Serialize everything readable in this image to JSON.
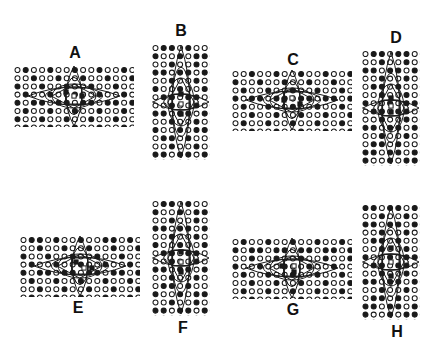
{
  "figure": {
    "type": "multi-panel-lattice-diagram",
    "background_color": "#ffffff",
    "ink_color": "#1a1a1a",
    "panel_count": 8,
    "panel_labels": [
      "A",
      "B",
      "C",
      "D",
      "E",
      "F",
      "G",
      "H"
    ]
  },
  "legend": {
    "open_circle": "open-circle-site",
    "filled_circle": "filled-circle-site",
    "open_square": "open-square-marker",
    "filled_square": "filled-square-marker"
  },
  "panels": [
    {
      "id": "A",
      "label": "A",
      "label_position": "top",
      "orientation": "landscape",
      "x": 14,
      "y": 66,
      "w": 120,
      "h": 61,
      "label_x": 63,
      "label_y": 45,
      "cols": 15,
      "rows": 8,
      "spacing_x": 8.2,
      "spacing_y": 8.2,
      "dot_radius": 2.5,
      "pattern": [
        "010010010010010",
        "001001001001001",
        "100100100100100",
        "010010010010010",
        "101101101101101",
        "010010010010010",
        "100100100100100",
        "010010010010010"
      ],
      "overlay": {
        "horizontal_lens": {
          "cx": 60,
          "cy": 30,
          "rx": 46,
          "ry": 9
        },
        "vertical_lens": {
          "cx": 60,
          "cy": 30,
          "rx": 8,
          "ry": 30
        },
        "mid_ellipse": {
          "cx": 60,
          "cy": 30,
          "rx": 22,
          "ry": 12
        },
        "rect": {
          "x": 52,
          "y": 22,
          "w": 16,
          "h": 16
        },
        "markers": [
          {
            "type": "filled-square",
            "x": 52,
            "y": 26
          },
          {
            "type": "filled-square",
            "x": 68,
            "y": 30
          },
          {
            "type": "open-square",
            "x": 60,
            "y": 30
          }
        ]
      }
    },
    {
      "id": "B",
      "label": "B",
      "label_position": "top",
      "orientation": "portrait",
      "x": 152,
      "y": 44,
      "w": 58,
      "h": 116,
      "label_x": 169,
      "label_y": 23,
      "cols": 8,
      "rows": 15,
      "spacing_x": 8.2,
      "spacing_y": 8.2,
      "dot_radius": 2.5,
      "pattern": [
        "01101001",
        "10010110",
        "00100100",
        "11011011",
        "00100100",
        "10010010",
        "01101101",
        "00100100",
        "11011011",
        "00100100",
        "10010110",
        "01101001",
        "00100100",
        "11011011",
        "01101001"
      ],
      "overlay": {
        "horizontal_lens": {
          "cx": 29,
          "cy": 58,
          "rx": 28,
          "ry": 8
        },
        "vertical_lens": {
          "cx": 29,
          "cy": 58,
          "rx": 9,
          "ry": 56
        },
        "mid_ellipse": {
          "cx": 29,
          "cy": 58,
          "rx": 13,
          "ry": 24
        },
        "rect": {
          "x": 21,
          "y": 50,
          "w": 16,
          "h": 16
        },
        "markers": [
          {
            "type": "filled-square",
            "x": 29,
            "y": 50
          },
          {
            "type": "filled-square",
            "x": 29,
            "y": 70
          },
          {
            "type": "open-square",
            "x": 29,
            "y": 60
          }
        ]
      }
    },
    {
      "id": "C",
      "label": "C",
      "label_position": "top",
      "orientation": "landscape",
      "x": 232,
      "y": 70,
      "w": 120,
      "h": 61,
      "label_x": 281,
      "label_y": 52,
      "cols": 15,
      "rows": 8,
      "spacing_x": 8.2,
      "spacing_y": 8.2,
      "dot_radius": 2.5,
      "pattern": [
        "001001001001001",
        "100100100100100",
        "010010010010010",
        "101101101101101",
        "010010010010010",
        "001001001001001",
        "010010010010010",
        "001001001001001"
      ],
      "overlay": {
        "horizontal_lens": {
          "cx": 60,
          "cy": 30,
          "rx": 46,
          "ry": 9
        },
        "vertical_lens": {
          "cx": 60,
          "cy": 30,
          "rx": 8,
          "ry": 30
        },
        "mid_ellipse": {
          "cx": 60,
          "cy": 30,
          "rx": 22,
          "ry": 12
        },
        "rect": {
          "x": 52,
          "y": 22,
          "w": 16,
          "h": 16
        },
        "markers": [
          {
            "type": "filled-square",
            "x": 52,
            "y": 30
          },
          {
            "type": "filled-square",
            "x": 68,
            "y": 34
          },
          {
            "type": "open-square",
            "x": 60,
            "y": 28
          }
        ]
      }
    },
    {
      "id": "D",
      "label": "D",
      "label_position": "top",
      "orientation": "portrait",
      "x": 362,
      "y": 50,
      "w": 58,
      "h": 116,
      "label_x": 384,
      "label_y": 30,
      "cols": 8,
      "rows": 15,
      "spacing_x": 8.2,
      "spacing_y": 8.2,
      "dot_radius": 2.5,
      "pattern": [
        "01101101",
        "00100100",
        "11011011",
        "00100100",
        "01101001",
        "00100100",
        "10010110",
        "01101101",
        "00100100",
        "11011011",
        "00100100",
        "01101001",
        "11011011",
        "10010110",
        "01101001"
      ],
      "overlay": {
        "horizontal_lens": {
          "cx": 29,
          "cy": 58,
          "rx": 28,
          "ry": 8
        },
        "vertical_lens": {
          "cx": 29,
          "cy": 58,
          "rx": 9,
          "ry": 56
        },
        "mid_ellipse": {
          "cx": 29,
          "cy": 58,
          "rx": 13,
          "ry": 24
        },
        "rect": {
          "x": 21,
          "y": 50,
          "w": 16,
          "h": 16
        },
        "markers": [
          {
            "type": "filled-square",
            "x": 29,
            "y": 48
          },
          {
            "type": "filled-square",
            "x": 29,
            "y": 62
          },
          {
            "type": "open-square",
            "x": 29,
            "y": 56
          }
        ]
      }
    },
    {
      "id": "E",
      "label": "E",
      "label_position": "bottom",
      "orientation": "landscape",
      "x": 20,
      "y": 236,
      "w": 120,
      "h": 61,
      "label_x": 66,
      "label_y": 300,
      "cols": 15,
      "rows": 8,
      "spacing_x": 8.2,
      "spacing_y": 8.2,
      "dot_radius": 2.5,
      "pattern": [
        "011010010011010",
        "001001001001001",
        "100100100100100",
        "010010010010010",
        "101101101101101",
        "010010010010010",
        "001001001001001",
        "010010010010010"
      ],
      "overlay": {
        "horizontal_lens": {
          "cx": 60,
          "cy": 30,
          "rx": 46,
          "ry": 9
        },
        "vertical_lens": {
          "cx": 60,
          "cy": 30,
          "rx": 8,
          "ry": 30
        },
        "mid_ellipse": {
          "cx": 60,
          "cy": 30,
          "rx": 22,
          "ry": 12
        },
        "rect": {
          "x": 52,
          "y": 22,
          "w": 16,
          "h": 16
        },
        "markers": [
          {
            "type": "filled-square",
            "x": 56,
            "y": 26
          },
          {
            "type": "filled-square",
            "x": 72,
            "y": 32
          },
          {
            "type": "open-square",
            "x": 64,
            "y": 32
          }
        ]
      }
    },
    {
      "id": "F",
      "label": "F",
      "label_position": "bottom",
      "orientation": "portrait",
      "x": 152,
      "y": 200,
      "w": 58,
      "h": 116,
      "label_x": 171,
      "label_y": 320,
      "cols": 8,
      "rows": 15,
      "spacing_x": 8.2,
      "spacing_y": 8.2,
      "dot_radius": 2.5,
      "pattern": [
        "01101001",
        "10010110",
        "00100100",
        "11011011",
        "00100100",
        "10010010",
        "01101101",
        "00100100",
        "11011011",
        "00100100",
        "01101001",
        "10010110",
        "00100100",
        "11011011",
        "01101001"
      ],
      "overlay": {
        "horizontal_lens": {
          "cx": 29,
          "cy": 58,
          "rx": 28,
          "ry": 8
        },
        "vertical_lens": {
          "cx": 29,
          "cy": 58,
          "rx": 9,
          "ry": 56
        },
        "mid_ellipse": {
          "cx": 29,
          "cy": 58,
          "rx": 13,
          "ry": 24
        },
        "rect": {
          "x": 21,
          "y": 50,
          "w": 16,
          "h": 16
        },
        "markers": [
          {
            "type": "filled-square",
            "x": 29,
            "y": 52
          },
          {
            "type": "filled-square",
            "x": 29,
            "y": 72
          },
          {
            "type": "open-square",
            "x": 29,
            "y": 62
          }
        ]
      }
    },
    {
      "id": "G",
      "label": "G",
      "label_position": "bottom",
      "orientation": "landscape",
      "x": 232,
      "y": 238,
      "w": 120,
      "h": 61,
      "label_x": 281,
      "label_y": 302,
      "cols": 15,
      "rows": 8,
      "spacing_x": 8.2,
      "spacing_y": 8.2,
      "dot_radius": 2.5,
      "pattern": [
        "010010010010010",
        "101101101101101",
        "001001001001001",
        "100100100100100",
        "010010010010010",
        "001001001001001",
        "010010010010010",
        "001001001001001"
      ],
      "overlay": {
        "horizontal_lens": {
          "cx": 60,
          "cy": 30,
          "rx": 46,
          "ry": 9
        },
        "vertical_lens": {
          "cx": 60,
          "cy": 30,
          "rx": 8,
          "ry": 30
        },
        "mid_ellipse": {
          "cx": 60,
          "cy": 30,
          "rx": 22,
          "ry": 12
        },
        "rect": {
          "x": 52,
          "y": 22,
          "w": 16,
          "h": 16
        },
        "markers": [
          {
            "type": "filled-square",
            "x": 50,
            "y": 28
          },
          {
            "type": "filled-square",
            "x": 62,
            "y": 34
          },
          {
            "type": "open-square",
            "x": 62,
            "y": 28
          }
        ]
      }
    },
    {
      "id": "H",
      "label": "H",
      "label_position": "bottom",
      "orientation": "portrait",
      "x": 362,
      "y": 204,
      "w": 58,
      "h": 116,
      "label_x": 385,
      "label_y": 324,
      "cols": 8,
      "rows": 15,
      "spacing_x": 8.2,
      "spacing_y": 8.2,
      "dot_radius": 2.5,
      "pattern": [
        "11011011",
        "00100100",
        "11011011",
        "00100100",
        "01101001",
        "00100100",
        "10010110",
        "01101101",
        "00100100",
        "11011011",
        "00100100",
        "01101001",
        "11011011",
        "10010110",
        "01101001"
      ],
      "overlay": {
        "horizontal_lens": {
          "cx": 29,
          "cy": 58,
          "rx": 28,
          "ry": 8
        },
        "vertical_lens": {
          "cx": 29,
          "cy": 58,
          "rx": 9,
          "ry": 56
        },
        "mid_ellipse": {
          "cx": 29,
          "cy": 58,
          "rx": 13,
          "ry": 24
        },
        "rect": {
          "x": 21,
          "y": 50,
          "w": 16,
          "h": 16
        },
        "markers": [
          {
            "type": "filled-square",
            "x": 29,
            "y": 44
          },
          {
            "type": "filled-square",
            "x": 29,
            "y": 72
          },
          {
            "type": "open-square",
            "x": 29,
            "y": 58
          }
        ]
      }
    }
  ]
}
